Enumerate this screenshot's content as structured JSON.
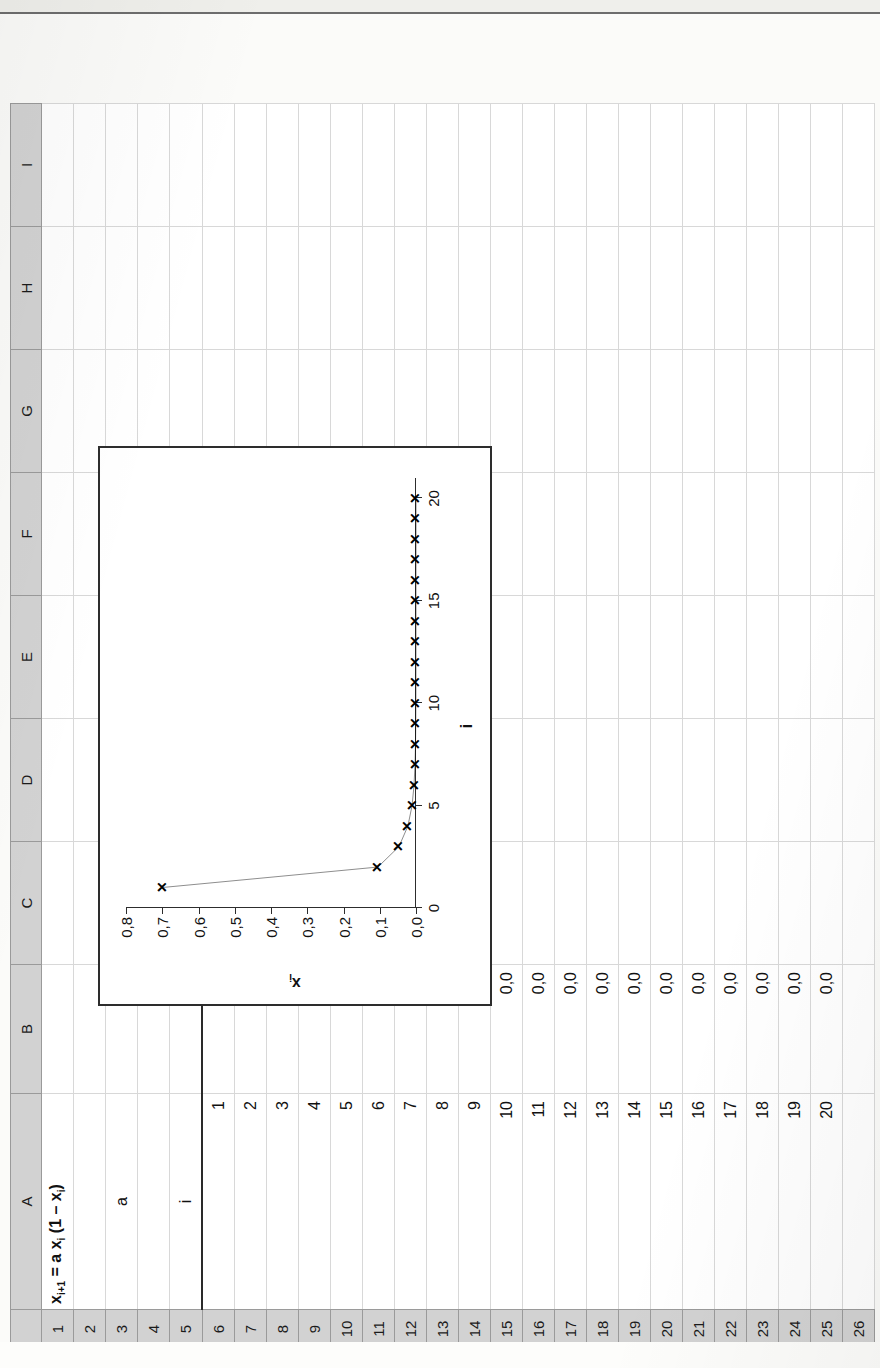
{
  "app": {
    "type": "spreadsheet-scan",
    "orientation": "rotated-90-ccw"
  },
  "sheet": {
    "column_headers": [
      "A",
      "B",
      "C",
      "D",
      "E",
      "F",
      "G",
      "H",
      "I"
    ],
    "row_headers": [
      "1",
      "2",
      "3",
      "4",
      "5",
      "6",
      "7",
      "8",
      "9",
      "10",
      "11",
      "12",
      "13",
      "14",
      "15",
      "16",
      "17",
      "18",
      "19",
      "20",
      "21",
      "22",
      "23",
      "24",
      "25",
      "26"
    ],
    "title_cell": "x<sub>i+1</sub> = a x<sub>i</sub> (1 – x<sub>i</sub>)",
    "title_plain": "x(i+1) = a x(i) (1 - x(i))",
    "parameter_label": "a",
    "parameter_value": "0,5",
    "header_i": "i",
    "header_xi": "x<sub>i</sub>",
    "rows": [
      {
        "i": "1",
        "x": "0,7"
      },
      {
        "i": "2",
        "x": "0,1"
      },
      {
        "i": "3",
        "x": "0,0"
      },
      {
        "i": "4",
        "x": "0,0"
      },
      {
        "i": "5",
        "x": "0,0"
      },
      {
        "i": "6",
        "x": "0,0"
      },
      {
        "i": "7",
        "x": "0,0"
      },
      {
        "i": "8",
        "x": "0,0"
      },
      {
        "i": "9",
        "x": "0,0"
      },
      {
        "i": "10",
        "x": "0,0"
      },
      {
        "i": "11",
        "x": "0,0"
      },
      {
        "i": "12",
        "x": "0,0"
      },
      {
        "i": "13",
        "x": "0,0"
      },
      {
        "i": "14",
        "x": "0,0"
      },
      {
        "i": "15",
        "x": "0,0"
      },
      {
        "i": "16",
        "x": "0,0"
      },
      {
        "i": "17",
        "x": "0,0"
      },
      {
        "i": "18",
        "x": "0,0"
      },
      {
        "i": "19",
        "x": "0,0"
      },
      {
        "i": "20",
        "x": "0,0"
      }
    ]
  },
  "chart_data": {
    "type": "line",
    "title": "",
    "xlabel": "i",
    "ylabel": "xᵢ",
    "x": [
      1,
      2,
      3,
      4,
      5,
      6,
      7,
      8,
      9,
      10,
      11,
      12,
      13,
      14,
      15,
      16,
      17,
      18,
      19,
      20
    ],
    "values": [
      0.7,
      0.105,
      0.047,
      0.0224,
      0.0109,
      0.0054,
      0.0027,
      0.00135,
      0.00067,
      0.00034,
      0.00017,
      8e-05,
      4e-05,
      2e-05,
      1e-05,
      5e-06,
      2.5e-06,
      1.2e-06,
      6e-07,
      3e-07
    ],
    "series": [
      {
        "name": "xᵢ",
        "values": [
          0.7,
          0.105,
          0.047,
          0.0224,
          0.0109,
          0.0054,
          0.0027,
          0.00135,
          0.00067,
          0.00034,
          0.00017,
          8e-05,
          4e-05,
          2e-05,
          1e-05,
          5e-06,
          2.5e-06,
          1.2e-06,
          6e-07,
          3e-07
        ]
      }
    ],
    "xlim": [
      0,
      21
    ],
    "ylim": [
      0.0,
      0.8
    ],
    "x_ticks": [
      0,
      5,
      10,
      15,
      20
    ],
    "x_tick_labels": [
      "0",
      "5",
      "10",
      "15",
      "20"
    ],
    "y_ticks": [
      0.0,
      0.1,
      0.2,
      0.3,
      0.4,
      0.5,
      0.6,
      0.7,
      0.8
    ],
    "y_tick_labels": [
      "0,0",
      "0,1",
      "0,2",
      "0,3",
      "0,4",
      "0,5",
      "0,6",
      "0,7",
      "0,8"
    ],
    "grid": false,
    "legend": "none",
    "marker": "x",
    "line_color": "#000000"
  },
  "bleed_text": {
    "line1": "Wert",
    "line2": "wird",
    "line3": "die",
    "line4": "mit"
  }
}
